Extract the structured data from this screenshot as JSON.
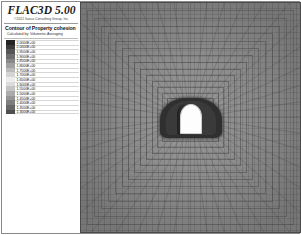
{
  "app": {
    "title": "FLAC3D 5.00",
    "copyright": "©2012 Itasca Consulting Group, Inc."
  },
  "legend": {
    "contour_title": "Contour of Property cohesion",
    "calculation_note": "Calculated by: Volumetric Averaging",
    "colorbar": {
      "orientation": "vertical",
      "colormap": "grayscale",
      "top_color": "#2b2b2b",
      "bottom_color": "#3c3c3c",
      "mid_color": "#f2f2f2"
    },
    "entries": [
      {
        "value": "2.0000E+00",
        "color": "#242424"
      },
      {
        "value": "2.0000E+00",
        "color": "#3b3b3b"
      },
      {
        "value": "1.9500E+00",
        "color": "#555555"
      },
      {
        "value": "1.9000E+00",
        "color": "#6e6e6e"
      },
      {
        "value": "1.8500E+00",
        "color": "#888888"
      },
      {
        "value": "1.8000E+00",
        "color": "#a1a1a1"
      },
      {
        "value": "1.7500E+00",
        "color": "#bbbbbb"
      },
      {
        "value": "1.7000E+00",
        "color": "#d4d4d4"
      },
      {
        "value": "1.6500E+00",
        "color": "#ededed"
      },
      {
        "value": "1.6000E+00",
        "color": "#dcdcdc"
      },
      {
        "value": "1.5500E+00",
        "color": "#c4c4c4"
      },
      {
        "value": "1.5000E+00",
        "color": "#ababab"
      },
      {
        "value": "1.4500E+00",
        "color": "#959595"
      },
      {
        "value": "1.4000E+00",
        "color": "#7d7d7d"
      },
      {
        "value": "1.3500E+00",
        "color": "#666666"
      },
      {
        "value": "1.3000E+00",
        "color": "#4f4f4f"
      }
    ]
  },
  "plot": {
    "background_color": "#8c8c8c",
    "border_color": "#4a4a4a",
    "mesh_description": "radially graded quadrilateral mesh",
    "tunnel": {
      "shape": "horseshoe-arch-opening",
      "fill_color": "#fdfdfd",
      "halo_color": "#2f2f2f"
    }
  }
}
